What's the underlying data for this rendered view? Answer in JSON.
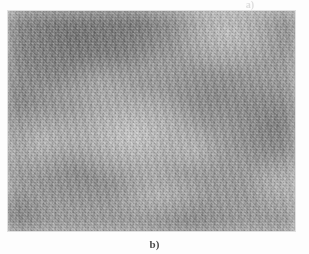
{
  "figure": {
    "caption": "b)",
    "bleed_through_label": "a)",
    "panel": {
      "name": "grayscale-texture-image",
      "x": 8,
      "y": 11,
      "width": 287,
      "height": 220,
      "base_color": "#9d9d9d",
      "light_color": "#c8c8c8",
      "dark_color": "#6e6e6e"
    },
    "page_background": "#fdfdfd",
    "caption_color": "#4a4a4a"
  }
}
